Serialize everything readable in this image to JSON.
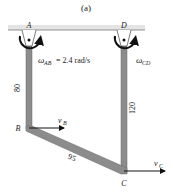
{
  "figure": {
    "caption": "(a)",
    "points": {
      "A": "A",
      "B": "B",
      "C": "C",
      "D": "D"
    },
    "omega_ab": {
      "symbol": "ω",
      "subscript": "AB",
      "value_text": "= 2.4 rad/s"
    },
    "omega_cd": {
      "symbol": "ω",
      "subscript": "CD"
    },
    "velocity_b": {
      "symbol": "v",
      "subscript": "B"
    },
    "velocity_c": {
      "symbol": "v",
      "subscript": "C"
    },
    "lengths": {
      "ab": "80",
      "cd": "120",
      "bc": "95"
    },
    "colors": {
      "bar": "#8a8a8a",
      "bar_edge": "#6a6a6a",
      "ceiling": "#d8d8d8",
      "arrow": "#111111"
    }
  }
}
